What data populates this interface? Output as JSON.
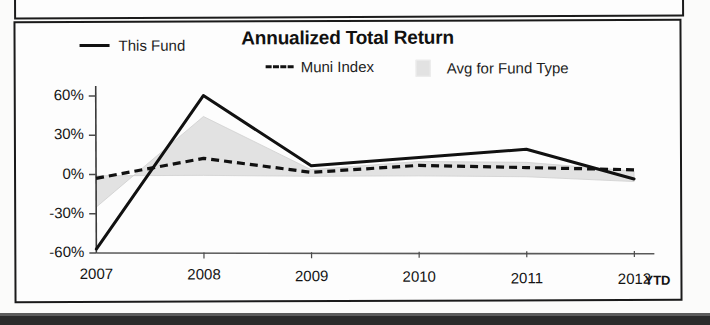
{
  "chart_data": {
    "type": "line",
    "title": "Annualized Total Return",
    "xlabel": "",
    "ylabel": "",
    "x": [
      "2007",
      "2008",
      "2009",
      "2010",
      "2011",
      "2012"
    ],
    "categories": [
      "2007",
      "2008",
      "2009",
      "2010",
      "2011",
      "2012"
    ],
    "xtick_suffix": "YTD",
    "ylim": [
      -60,
      60
    ],
    "ytick_labels": [
      "60%",
      "30%",
      "0%",
      "-30%",
      "-60%"
    ],
    "ytick_values": [
      60,
      30,
      0,
      -30,
      -60
    ],
    "grid": false,
    "legend_position": "top",
    "series": [
      {
        "name": "This Fund",
        "style": "solid",
        "color": "#111111",
        "values": [
          -57,
          60,
          6,
          12,
          18,
          -5
        ]
      },
      {
        "name": "Muni Index",
        "style": "dashed",
        "color": "#111111",
        "values": [
          -3,
          12,
          1,
          6,
          4,
          2
        ]
      },
      {
        "name": "Avg for Fund Type",
        "style": "band",
        "color": "#e2e2e2",
        "band_upper": [
          -25,
          44,
          3,
          9,
          8,
          1
        ],
        "band_lower": [
          -1,
          -1,
          -2,
          -2,
          -3,
          -7
        ]
      }
    ]
  },
  "chart": {
    "title": "Annualized Total Return",
    "legend": [
      {
        "label": "This Fund",
        "swatch": "solid-line-swatch"
      },
      {
        "label": "Muni Index",
        "swatch": "dashed-line-swatch"
      },
      {
        "label": "Avg for Fund Type",
        "swatch": "gray-box-swatch"
      }
    ],
    "y_axis": {
      "ticks": [
        "60%",
        "30%",
        "0%",
        "-30%",
        "-60%"
      ]
    },
    "x_axis": {
      "ticks": [
        "2007",
        "2008",
        "2009",
        "2010",
        "2011",
        "2012"
      ],
      "suffix": "YTD"
    }
  }
}
